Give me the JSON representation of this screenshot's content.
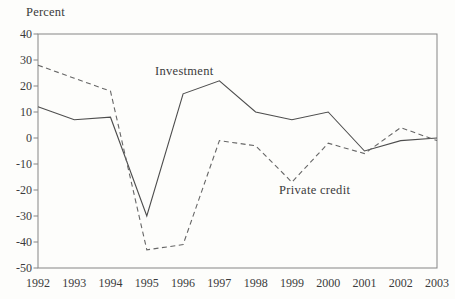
{
  "chart_data": {
    "type": "line",
    "title": "",
    "ylabel": "Percent",
    "xlabel": "",
    "x_labels": [
      "1992",
      "1993",
      "1994",
      "1995",
      "1996",
      "1997",
      "1998",
      "1999",
      "2000",
      "2001",
      "2002",
      "2003"
    ],
    "yticks": [
      40,
      30,
      20,
      10,
      0,
      -10,
      -20,
      -30,
      -40,
      -50
    ],
    "ylim": [
      -50,
      40
    ],
    "grid": false,
    "legend_position": "inline-annotations",
    "series": [
      {
        "name": "Investment",
        "line_style": "solid",
        "color": "#4d4d4d",
        "values": [
          12,
          7,
          8,
          -30,
          17,
          22,
          10,
          7,
          10,
          -5,
          -1,
          0
        ]
      },
      {
        "name": "Private credit",
        "line_style": "dashed",
        "color": "#666666",
        "values": [
          28,
          23,
          18,
          -43,
          -41,
          -1,
          -3,
          -17,
          -2,
          -6,
          4,
          -1
        ]
      }
    ],
    "axis_color": "#858585",
    "text_color": "#3b3b3b",
    "background": "#fdfdfb"
  }
}
